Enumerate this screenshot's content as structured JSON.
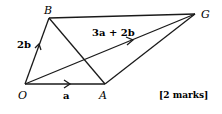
{
  "diagram": {
    "points": {
      "O": {
        "label": "O",
        "x": 25,
        "y": 84
      },
      "A": {
        "label": "A",
        "x": 105,
        "y": 84
      },
      "B": {
        "label": "B",
        "x": 49,
        "y": 18
      },
      "G": {
        "label": "G",
        "x": 195,
        "y": 14
      }
    },
    "vectors": {
      "OA": {
        "label": "a"
      },
      "OB": {
        "label": "2b"
      },
      "OG": {
        "label": "3a + 2b"
      }
    },
    "marks": "[2 marks]",
    "line_color": "#1a1a1a"
  }
}
